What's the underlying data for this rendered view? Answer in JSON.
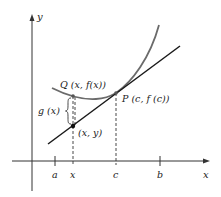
{
  "diagram": {
    "type": "mean-value / tangent line figure",
    "axes": {
      "x_label": "x",
      "y_label": "y"
    },
    "ticks": [
      {
        "id": "a",
        "label": "a"
      },
      {
        "id": "x",
        "label": "x"
      },
      {
        "id": "c",
        "label": "c"
      },
      {
        "id": "b",
        "label": "b"
      }
    ],
    "points": {
      "Q": {
        "label": "Q (x, f(x))"
      },
      "P": {
        "label": "P (c, f (c))"
      },
      "L": {
        "label": "(x, y)"
      }
    },
    "brace_label": "g (x)",
    "colors": {
      "curve": "#6b6b6b",
      "tangent": "#1a1a1a",
      "axes": "#333333",
      "text": "#222222"
    }
  }
}
